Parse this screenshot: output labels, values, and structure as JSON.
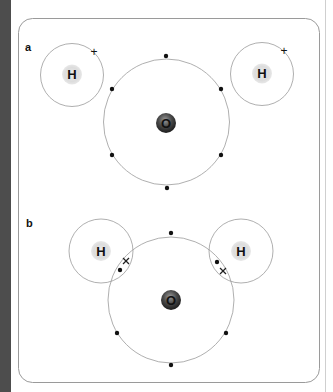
{
  "figure": {
    "panels": [
      {
        "label": "a",
        "description": "Separate hydrogen and oxygen atoms before bonding",
        "hydrogen_left": {
          "symbol": "H",
          "electron_marker": "+"
        },
        "hydrogen_right": {
          "symbol": "H",
          "electron_marker": "+"
        },
        "oxygen": {
          "symbol": "O",
          "outer_electrons": 6,
          "electron_marker": "dot"
        }
      },
      {
        "label": "b",
        "description": "Water molecule with shared electron pairs (covalent bonds)",
        "hydrogen_left": {
          "symbol": "H",
          "shared_pair": [
            "dot",
            "x"
          ]
        },
        "hydrogen_right": {
          "symbol": "H",
          "shared_pair": [
            "dot",
            "x"
          ]
        },
        "oxygen": {
          "symbol": "O",
          "non_bonding_electrons": 4,
          "electron_marker": "dot"
        }
      }
    ],
    "colors": {
      "orbit": "#9a9a9a",
      "border": "#9a9a9a",
      "electron": "#111111",
      "hydrogen_nucleus": "#d9d9d9",
      "oxygen_nucleus_dark": "#2b2b2b",
      "oxygen_nucleus_light": "#8c8c8c",
      "left_bar": "#4d4d4d"
    }
  }
}
